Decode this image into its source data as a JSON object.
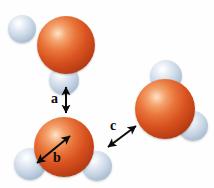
{
  "figure": {
    "background_color": "#fefefe",
    "width": 214,
    "height": 188
  },
  "colors": {
    "oxygen": "#d9521f",
    "oxygen_highlight": "#fde4cf",
    "oxygen_shadow": "#85290e",
    "hydrogen": "#c3d2e2",
    "hydrogen_highlight": "#ffffff",
    "hydrogen_shadow": "#7e93ac",
    "arrow": "#0b0b0b",
    "label": "#0b0b0b"
  },
  "molecules": [
    {
      "id": "molecule-top-left",
      "oxygen": {
        "cx": 66,
        "cy": 45,
        "r": 29
      },
      "hydrogens": [
        {
          "id": "hydrogen-upper-left",
          "cx": 22,
          "cy": 29,
          "r": 14
        },
        {
          "id": "hydrogen-lower",
          "cx": 64,
          "cy": 80,
          "r": 15
        }
      ]
    },
    {
      "id": "molecule-bottom-left",
      "oxygen": {
        "cx": 64,
        "cy": 147,
        "r": 30
      },
      "hydrogens": [
        {
          "id": "hydrogen-left",
          "cx": 30,
          "cy": 164,
          "r": 16
        },
        {
          "id": "hydrogen-right",
          "cx": 97,
          "cy": 166,
          "r": 15
        }
      ]
    },
    {
      "id": "molecule-right",
      "oxygen": {
        "cx": 165,
        "cy": 109,
        "r": 30
      },
      "hydrogens": [
        {
          "id": "hydrogen-top",
          "cx": 166,
          "cy": 76,
          "r": 16
        },
        {
          "id": "hydrogen-lower-right",
          "cx": 193,
          "cy": 126,
          "r": 15
        }
      ]
    }
  ],
  "annotations": [
    {
      "id": "annotation-a",
      "label": "a",
      "label_x": 51,
      "label_y": 92,
      "arrow": {
        "x1": 66,
        "y1": 87,
        "x2": 66,
        "y2": 113
      },
      "description": "hydrogen bond distance between lower hydrogen of top molecule and oxygen of bottom molecule"
    },
    {
      "id": "annotation-b",
      "label": "b",
      "label_x": 53,
      "label_y": 151,
      "arrow": {
        "x1": 37,
        "y1": 163,
        "x2": 70,
        "y2": 136
      },
      "description": "covalent O-H bond length within bottom-left molecule"
    },
    {
      "id": "annotation-c",
      "label": "c",
      "label_x": 110,
      "label_y": 119,
      "arrow": {
        "x1": 108,
        "y1": 147,
        "x2": 136,
        "y2": 126
      },
      "description": "hydrogen bond distance between right hydrogen of bottom molecule and oxygen of right molecule"
    }
  ]
}
